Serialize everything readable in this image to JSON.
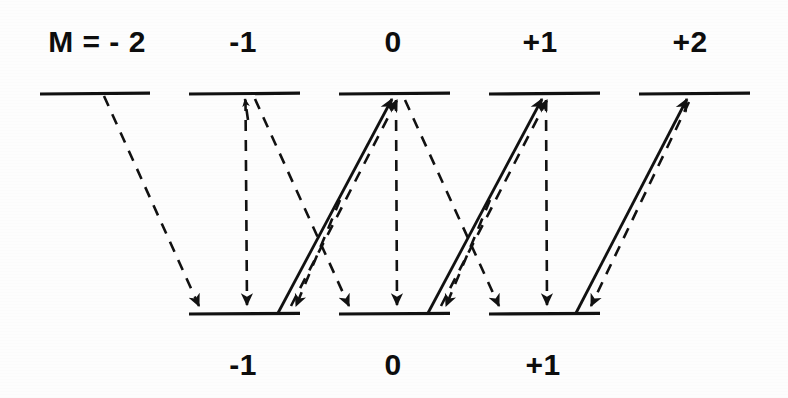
{
  "figure": {
    "kind": "atomic-energy-level-transition-diagram",
    "background_color": "#fdfdfd",
    "line_color": "#111111",
    "upper_row_label_prefix": "M = ",
    "upper_labels": [
      {
        "id": "upper-m-minus-2",
        "text": "M = - 2",
        "cx": 97,
        "cy": 52
      },
      {
        "id": "upper-m-minus-1",
        "text": "-1",
        "cx": 243,
        "cy": 52
      },
      {
        "id": "upper-m-zero",
        "text": "0",
        "cx": 393,
        "cy": 52
      },
      {
        "id": "upper-m-plus-1",
        "text": "+1",
        "cx": 540,
        "cy": 52
      },
      {
        "id": "upper-m-plus-2",
        "text": "+2",
        "cx": 690,
        "cy": 52
      }
    ],
    "lower_labels": [
      {
        "id": "lower-m-minus-1",
        "text": "-1",
        "cx": 243,
        "cy": 375
      },
      {
        "id": "lower-m-zero",
        "text": "0",
        "cx": 393,
        "cy": 375
      },
      {
        "id": "lower-m-plus-1",
        "text": "+1",
        "cx": 543,
        "cy": 375
      }
    ],
    "upper_levels": [
      {
        "id": "upper-level-m-minus-2",
        "m": "-2",
        "x1": 40,
        "x2": 150,
        "y": 94
      },
      {
        "id": "upper-level-m-minus-1",
        "m": "-1",
        "x1": 189,
        "x2": 300,
        "y": 94
      },
      {
        "id": "upper-level-m-zero",
        "m": "0",
        "x1": 339,
        "x2": 450,
        "y": 94
      },
      {
        "id": "upper-level-m-plus-1",
        "m": "+1",
        "x1": 489,
        "x2": 600,
        "y": 94
      },
      {
        "id": "upper-level-m-plus-2",
        "m": "+2",
        "x1": 639,
        "x2": 750,
        "y": 94
      }
    ],
    "lower_levels": [
      {
        "id": "lower-level-m-minus-1",
        "m": "-1",
        "x1": 189,
        "x2": 300,
        "y": 314
      },
      {
        "id": "lower-level-m-zero",
        "m": "0",
        "x1": 339,
        "x2": 450,
        "y": 314
      },
      {
        "id": "lower-level-m-plus-1",
        "m": "+1",
        "x1": 489,
        "x2": 600,
        "y": 314
      }
    ],
    "transitions": [
      {
        "id": "t1",
        "style": "dashed",
        "direction": "down",
        "from": [
          104,
          96
        ],
        "to": [
          200,
          310
        ],
        "arrow_at": "end",
        "note": "upper M=-2 to lower M=-1"
      },
      {
        "id": "t2",
        "style": "dashed",
        "direction": "down",
        "from": [
          245,
          97
        ],
        "to": [
          247,
          309
        ],
        "arrow_at": "end",
        "note": "upper M=-1 to lower M=-1 vertical"
      },
      {
        "id": "t3",
        "style": "dashed",
        "direction": "up",
        "from": [
          247,
          309
        ],
        "to": [
          245,
          97
        ],
        "arrow_at": "end",
        "note": "upper M=-1 small upward head"
      },
      {
        "id": "t4",
        "style": "dashed",
        "direction": "down",
        "from": [
          255,
          99
        ],
        "to": [
          350,
          310
        ],
        "arrow_at": "end",
        "note": "upper M=-1 to lower M=0"
      },
      {
        "id": "t5",
        "style": "solid",
        "direction": "up",
        "from": [
          278,
          312
        ],
        "to": [
          392,
          98
        ],
        "arrow_at": "end",
        "note": "lower M=-1 to upper M=0 solid"
      },
      {
        "id": "t6",
        "style": "dashed",
        "direction": "up",
        "from": [
          290,
          310
        ],
        "to": [
          396,
          99
        ],
        "arrow_at": "end",
        "note": "lower M=-1 right to upper M=0 dashed"
      },
      {
        "id": "t7",
        "style": "dashed",
        "direction": "down",
        "from": [
          295,
          310
        ],
        "to": [
          295,
          310
        ],
        "arrow_at": "end",
        "note": "arrowhead at lower M=-1 right end"
      },
      {
        "id": "t8",
        "style": "dashed",
        "direction": "down",
        "from": [
          396,
          98
        ],
        "to": [
          397,
          309
        ],
        "arrow_at": "end",
        "note": "upper M=0 to lower M=0 vertical"
      },
      {
        "id": "t9",
        "style": "dashed",
        "direction": "down",
        "from": [
          404,
          100
        ],
        "to": [
          500,
          310
        ],
        "arrow_at": "end",
        "note": "upper M=0 to lower M=+1"
      },
      {
        "id": "t10",
        "style": "solid",
        "direction": "up",
        "from": [
          428,
          312
        ],
        "to": [
          542,
          98
        ],
        "arrow_at": "end",
        "note": "lower M=0 to upper M=+1 solid"
      },
      {
        "id": "t11",
        "style": "dashed",
        "direction": "up",
        "from": [
          440,
          310
        ],
        "to": [
          546,
          99
        ],
        "arrow_at": "end",
        "note": "lower M=0 right to upper M=+1 dashed"
      },
      {
        "id": "t12",
        "style": "dashed",
        "direction": "down",
        "from": [
          546,
          98
        ],
        "to": [
          547,
          309
        ],
        "arrow_at": "end",
        "note": "upper M=+1 to lower M=+1 vertical"
      },
      {
        "id": "t13",
        "style": "solid",
        "direction": "up",
        "from": [
          576,
          312
        ],
        "to": [
          687,
          98
        ],
        "arrow_at": "end",
        "note": "lower M=+1 to upper M=+2 solid"
      },
      {
        "id": "t14",
        "style": "dashed",
        "direction": "down",
        "from": [
          690,
          100
        ],
        "to": [
          590,
          310
        ],
        "arrow_at": "end",
        "note": "upper M=+2 to lower M=+1 dashed"
      }
    ],
    "arrowheads_lower_level_ends": [
      {
        "id": "ah-l1-left",
        "x": 200,
        "y": 311,
        "dir": "down-right"
      },
      {
        "id": "ah-l1-center",
        "x": 247,
        "y": 311,
        "dir": "down"
      },
      {
        "id": "ah-l1-right",
        "x": 296,
        "y": 311,
        "dir": "down-right"
      },
      {
        "id": "ah-l2-left",
        "x": 350,
        "y": 311,
        "dir": "down-right"
      },
      {
        "id": "ah-l2-center",
        "x": 397,
        "y": 311,
        "dir": "down"
      },
      {
        "id": "ah-l2-right",
        "x": 446,
        "y": 311,
        "dir": "down-right"
      },
      {
        "id": "ah-l3-left",
        "x": 500,
        "y": 311,
        "dir": "down-right"
      },
      {
        "id": "ah-l3-center",
        "x": 547,
        "y": 311,
        "dir": "down"
      },
      {
        "id": "ah-l3-right",
        "x": 591,
        "y": 311,
        "dir": "down-right"
      }
    ]
  }
}
